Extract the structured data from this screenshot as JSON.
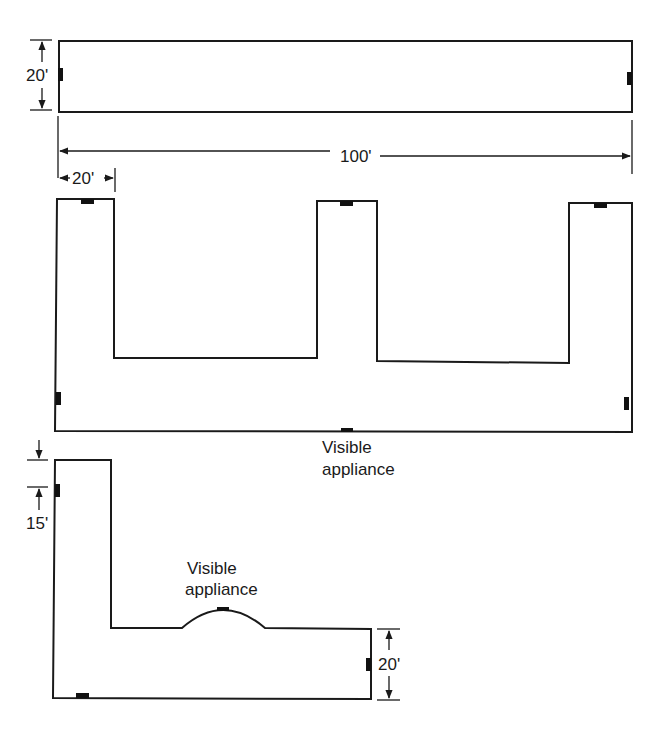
{
  "diagram": {
    "type": "building floor plans (top view) with appliance locations",
    "colors": {
      "line": "#1a1a1a",
      "appliance": "#111111",
      "background": "#ffffff"
    },
    "plan_1": {
      "shape": "rectangle",
      "height_label": "20'",
      "length_label": "100'"
    },
    "plan_2": {
      "shape": "E / comb shape with three 20' wide wings",
      "wing_width_label": "20'",
      "appliance_label_line1": "Visible",
      "appliance_label_line2": "appliance"
    },
    "plan_3": {
      "shape": "L shape with curved bump",
      "offset_label": "15'",
      "height_label": "20'",
      "appliance_label_line1": "Visible",
      "appliance_label_line2": "appliance"
    }
  }
}
